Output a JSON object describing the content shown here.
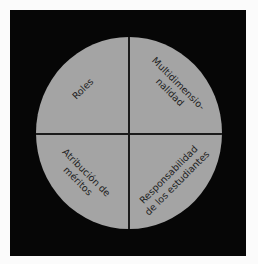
{
  "diagram": {
    "type": "quadrant-circle",
    "colors": {
      "background": "#fbfbfb",
      "frame": "#060606",
      "circle": "#a4a4a4",
      "divider": "#1b1b1b",
      "text": "#1e1e1e"
    },
    "quadrants": [
      {
        "position": "top-left",
        "lines": [
          "Roles"
        ]
      },
      {
        "position": "top-right",
        "lines": [
          "Multidimensio-",
          "nalidad"
        ]
      },
      {
        "position": "bottom-left",
        "lines": [
          "Atribución de",
          "méritos"
        ]
      },
      {
        "position": "bottom-right",
        "lines": [
          "Responsabilidad",
          "de los estudiantes"
        ]
      }
    ]
  }
}
